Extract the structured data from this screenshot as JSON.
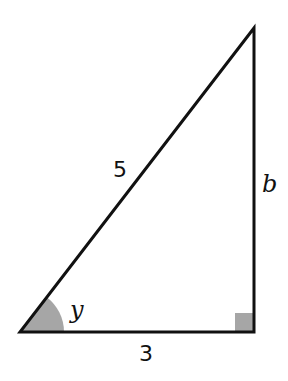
{
  "diagram": {
    "type": "right-triangle",
    "hypotenuse_label": "5",
    "adjacent_label": "3",
    "opposite_label": "b",
    "angle_label": "y",
    "colors": {
      "stroke": "#111111",
      "angle_fill": "#a6a6a6",
      "right_angle_fill": "#a6a6a6",
      "background": "#ffffff"
    },
    "vertices": {
      "bottom_left": [
        20,
        332
      ],
      "bottom_right": [
        254,
        332
      ],
      "top_right": [
        254,
        28
      ]
    }
  }
}
